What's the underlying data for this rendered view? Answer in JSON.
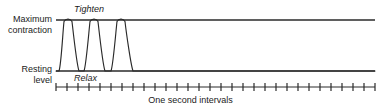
{
  "figure": {
    "caption": "One second intervals",
    "axis_labels": {
      "maximum_contraction": "Maximum\ncontraction",
      "maximum_contraction_line1": "Maximum",
      "maximum_contraction_line2": "contraction",
      "resting_level_line1": "Resting",
      "resting_level_line2": "level"
    },
    "annotations": {
      "tighten": "Tighten",
      "relax": "Relax"
    },
    "colors": {
      "ink": "#1b1b1b",
      "line": "#2a2a2a",
      "background": "#ffffff"
    }
  },
  "chart_data": {
    "type": "line",
    "title": "",
    "xlabel": "One second intervals",
    "ylabel": "",
    "grid": false,
    "legend": false,
    "axis_range_labels": {
      "y_top": "Maximum contraction",
      "y_bottom": "Resting level"
    },
    "ylim": [
      0,
      1
    ],
    "xlim": [
      0,
      29
    ],
    "tick_count": 30,
    "tick_unit_seconds": 1,
    "plot_geometry": {
      "left_px": 56,
      "right_px": 375,
      "top_line_y_px": 20,
      "baseline_y_px": 71,
      "tick_axis_y_px": 87,
      "tick_half_height_px": 4
    },
    "series": [
      {
        "name": "Muscle tension",
        "description": "Three successive contraction pulses rising from resting level to maximum contraction, then returning to resting level; flat at resting level thereafter.",
        "pulses": [
          {
            "index": 1,
            "start_x_px": 59,
            "peak_start_x_px": 64,
            "peak_end_x_px": 72,
            "end_x_px": 79,
            "peak_value": 1.0,
            "base_value": 0.0
          },
          {
            "index": 2,
            "start_x_px": 84,
            "peak_start_x_px": 90,
            "peak_end_x_px": 98,
            "end_x_px": 105,
            "peak_value": 1.0,
            "base_value": 0.0
          },
          {
            "index": 3,
            "start_x_px": 111,
            "peak_start_x_px": 117,
            "peak_end_x_px": 125,
            "end_x_px": 133,
            "peak_value": 1.0,
            "base_value": 0.0
          }
        ],
        "x": [
          0,
          1,
          2,
          3,
          4,
          5,
          6,
          7,
          8,
          9,
          10,
          11,
          12,
          13,
          14,
          15,
          16,
          17,
          18,
          19,
          20,
          21,
          22,
          23,
          24,
          25,
          26,
          27,
          28,
          29
        ],
        "values": [
          0,
          1,
          0,
          1,
          0,
          1,
          0,
          0,
          0,
          0,
          0,
          0,
          0,
          0,
          0,
          0,
          0,
          0,
          0,
          0,
          0,
          0,
          0,
          0,
          0,
          0,
          0,
          0,
          0,
          0
        ]
      }
    ]
  }
}
